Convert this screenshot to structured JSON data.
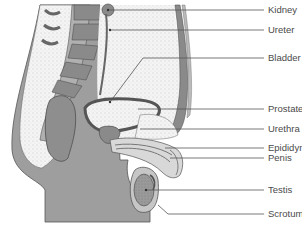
{
  "diagram": {
    "type": "anatomical-cross-section",
    "colors": {
      "tissue_dark": "#8c8c8c",
      "tissue_mid": "#a8a8a8",
      "tissue_light": "#d4d4d4",
      "background": "#ffffff",
      "line": "#555555",
      "text": "#4a4a4a"
    },
    "labels": [
      {
        "id": "kidney",
        "text": "Kidney",
        "x": 268,
        "y": 4,
        "line_from": [
          108,
          10
        ],
        "line_to": [
          264,
          10
        ]
      },
      {
        "id": "ureter",
        "text": "Ureter",
        "x": 268,
        "y": 24,
        "line_from": [
          110,
          30
        ],
        "line_to": [
          264,
          30
        ]
      },
      {
        "id": "bladder",
        "text": "Bladder",
        "x": 268,
        "y": 52,
        "line_from": [
          110,
          102
        ],
        "line_to": [
          264,
          58
        ],
        "bend": [
          143,
          58
        ]
      },
      {
        "id": "prostate",
        "text": "Prostate gland",
        "x": 268,
        "y": 103,
        "line_from": [
          138,
          109
        ],
        "line_to": [
          264,
          109
        ]
      },
      {
        "id": "urethra",
        "text": "Urethra",
        "x": 268,
        "y": 123,
        "line_from": [
          140,
          129
        ],
        "line_to": [
          264,
          129
        ]
      },
      {
        "id": "epididymis",
        "text": "Epididymis",
        "x": 268,
        "y": 142,
        "line_from": [
          165,
          148
        ],
        "line_to": [
          264,
          148
        ]
      },
      {
        "id": "penis",
        "text": "Penis",
        "x": 268,
        "y": 152,
        "line_from": [
          170,
          158
        ],
        "line_to": [
          264,
          158
        ]
      },
      {
        "id": "testis",
        "text": "Testis",
        "x": 268,
        "y": 184,
        "line_from": [
          146,
          190
        ],
        "line_to": [
          264,
          190
        ]
      },
      {
        "id": "scrotum",
        "text": "Scrotum",
        "x": 268,
        "y": 208,
        "line_from": [
          158,
          205
        ],
        "line_to": [
          264,
          214
        ],
        "bend": [
          168,
          214
        ]
      }
    ]
  }
}
